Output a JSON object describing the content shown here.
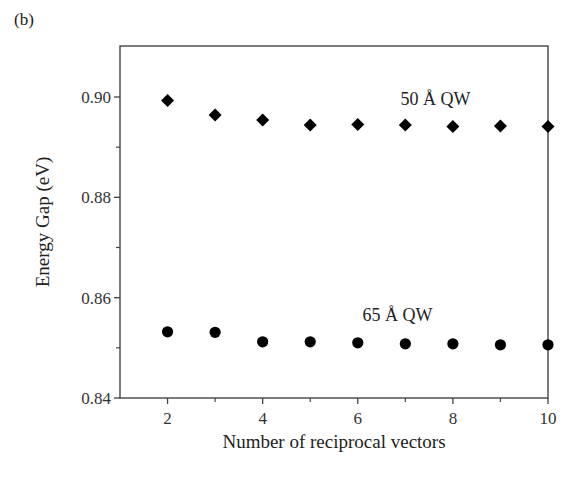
{
  "panel_label": "(b)",
  "chart_data": {
    "type": "scatter",
    "title": "",
    "xlabel": "Number of reciprocal vectors",
    "ylabel": "Energy Gap (eV)",
    "xlim": [
      1,
      10
    ],
    "ylim": [
      0.84,
      0.91
    ],
    "xticks": [
      2,
      4,
      6,
      8,
      10
    ],
    "xtick_labels": [
      "2",
      "4",
      "6",
      "8",
      "10"
    ],
    "xminor_ticks": [
      3,
      5,
      7,
      9
    ],
    "yticks": [
      0.84,
      0.86,
      0.88,
      0.9
    ],
    "ytick_labels": [
      "0.84",
      "0.86",
      "0.88",
      "0.90"
    ],
    "yminor_ticks": [
      0.85,
      0.87,
      0.89
    ],
    "grid": false,
    "legend": null,
    "series": [
      {
        "name": "50 Å QW",
        "marker": "diamond",
        "color": "#000000",
        "x": [
          2,
          3,
          4,
          5,
          6,
          7,
          8,
          9,
          10
        ],
        "y": [
          0.8993,
          0.8964,
          0.8954,
          0.8944,
          0.8945,
          0.8944,
          0.8941,
          0.8942,
          0.8941
        ]
      },
      {
        "name": "65 Å QW",
        "marker": "circle",
        "color": "#000000",
        "x": [
          2,
          3,
          4,
          5,
          6,
          7,
          8,
          9,
          10
        ],
        "y": [
          0.8532,
          0.8531,
          0.8512,
          0.8512,
          0.851,
          0.8508,
          0.8508,
          0.8506,
          0.8506
        ]
      }
    ],
    "annotations": [
      {
        "text": "50 Å QW",
        "x": 6.9,
        "y": 0.8985
      },
      {
        "text": "65 Å QW",
        "x": 6.1,
        "y": 0.8553
      }
    ]
  }
}
